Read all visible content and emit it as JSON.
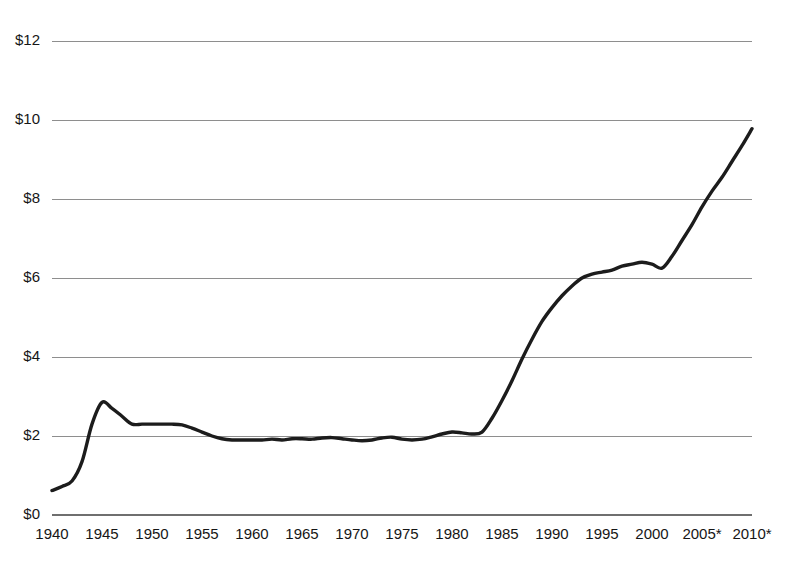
{
  "chart_data": {
    "type": "line",
    "title": "",
    "subtitle": "",
    "xlabel": "",
    "ylabel": "",
    "xlim": [
      1940,
      2010
    ],
    "ylim": [
      0,
      12
    ],
    "grid": true,
    "legend": false,
    "legend_position": "none",
    "line_color": "#1c1c1c",
    "grid_color": "#8e8e8e",
    "background_color": "#ffffff",
    "y_ticks": [
      0,
      2,
      4,
      6,
      8,
      10,
      12
    ],
    "y_tick_labels": [
      "$0",
      "$2",
      "$4",
      "$6",
      "$8",
      "$10",
      "$12"
    ],
    "x_ticks": [
      1940,
      1945,
      1950,
      1955,
      1960,
      1965,
      1970,
      1975,
      1980,
      1985,
      1990,
      1995,
      2000,
      2005,
      2010
    ],
    "x_tick_labels": [
      "1940",
      "1945",
      "1950",
      "1955",
      "1960",
      "1965",
      "1970",
      "1975",
      "1980",
      "1985",
      "1990",
      "1995",
      "2000",
      "2005*",
      "2010*"
    ],
    "annotations": [
      "* asterisk marks 2005 and 2010 tick labels"
    ],
    "series": [
      {
        "name": "value",
        "x": [
          1940,
          1941,
          1942,
          1943,
          1944,
          1945,
          1946,
          1947,
          1948,
          1949,
          1950,
          1951,
          1952,
          1953,
          1954,
          1955,
          1956,
          1957,
          1958,
          1959,
          1960,
          1961,
          1962,
          1963,
          1964,
          1965,
          1966,
          1967,
          1968,
          1969,
          1970,
          1971,
          1972,
          1973,
          1974,
          1975,
          1976,
          1977,
          1978,
          1979,
          1980,
          1981,
          1982,
          1983,
          1984,
          1985,
          1986,
          1987,
          1988,
          1989,
          1990,
          1991,
          1992,
          1993,
          1994,
          1995,
          1996,
          1997,
          1998,
          1999,
          2000,
          2001,
          2002,
          2003,
          2004,
          2005,
          2006,
          2007,
          2008,
          2009,
          2010
        ],
        "values": [
          0.62,
          0.72,
          0.86,
          1.35,
          2.3,
          2.85,
          2.7,
          2.5,
          2.3,
          2.3,
          2.3,
          2.3,
          2.3,
          2.28,
          2.2,
          2.1,
          2.0,
          1.93,
          1.9,
          1.9,
          1.9,
          1.9,
          1.92,
          1.9,
          1.93,
          1.93,
          1.92,
          1.95,
          1.96,
          1.93,
          1.9,
          1.88,
          1.9,
          1.95,
          1.97,
          1.92,
          1.9,
          1.92,
          1.98,
          2.05,
          2.1,
          2.08,
          2.05,
          2.1,
          2.45,
          2.9,
          3.4,
          3.95,
          4.45,
          4.9,
          5.25,
          5.55,
          5.8,
          6.0,
          6.1,
          6.15,
          6.2,
          6.3,
          6.35,
          6.4,
          6.35,
          6.25,
          6.55,
          6.95,
          7.35,
          7.8,
          8.2,
          8.55,
          8.95,
          9.35,
          9.78
        ],
        "color": "#1c1c1c",
        "line_width": 3.4
      }
    ]
  },
  "axis": {
    "y_axis_name": "dollar-value-axis",
    "x_axis_name": "year-axis"
  }
}
